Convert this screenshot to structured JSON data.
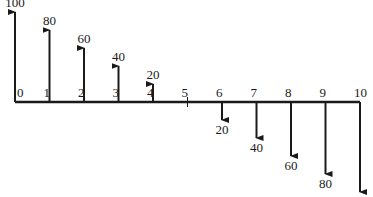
{
  "diagram": {
    "type": "cash-flow-diagram",
    "periods": [
      "0",
      "1",
      "2",
      "3",
      "4",
      "5",
      "6",
      "7",
      "8",
      "9",
      "10"
    ],
    "flows": [
      {
        "period": 0,
        "amount": 100,
        "direction": "up",
        "label": "100"
      },
      {
        "period": 1,
        "amount": 80,
        "direction": "up",
        "label": "80"
      },
      {
        "period": 2,
        "amount": 60,
        "direction": "up",
        "label": "60"
      },
      {
        "period": 3,
        "amount": 40,
        "direction": "up",
        "label": "40"
      },
      {
        "period": 4,
        "amount": 20,
        "direction": "up",
        "label": "20"
      },
      {
        "period": 6,
        "amount": 20,
        "direction": "down",
        "label": "20"
      },
      {
        "period": 7,
        "amount": 40,
        "direction": "down",
        "label": "40"
      },
      {
        "period": 8,
        "amount": 60,
        "direction": "down",
        "label": "60"
      },
      {
        "period": 9,
        "amount": 80,
        "direction": "down",
        "label": "80"
      },
      {
        "period": 10,
        "amount": 100,
        "direction": "down",
        "label": "100"
      }
    ],
    "colors": {
      "line": "#1a1a1a",
      "text": "#1a1a1a"
    }
  }
}
